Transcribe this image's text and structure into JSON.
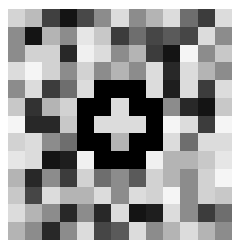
{
  "image": {
    "description": "Pixelated grayscale mosaic with a black ring and light cross shape at the center",
    "rows": 13,
    "cols": 13,
    "cells": [
      [
        "#d4d4d4",
        "#bbbbbb",
        "#404040",
        "#141414",
        "#484848",
        "#8c8c8c",
        "#dcdcdc",
        "#8c8c8c",
        "#b4b4b4",
        "#dcdcdc",
        "#6e6e6e",
        "#3c3c3c",
        "#dcdcdc"
      ],
      [
        "#8c8c8c",
        "#141414",
        "#b4b4b4",
        "#8c8c8c",
        "#e6e6e6",
        "#c8c8c8",
        "#3c3c3c",
        "#6e6e6e",
        "#464646",
        "#5a5a5a",
        "#464646",
        "#dcdcdc",
        "#8c8c8c"
      ],
      [
        "#8c8c8c",
        "#d2d2d2",
        "#d2d2d2",
        "#282828",
        "#f0f0f0",
        "#dcdcdc",
        "#8c8c8c",
        "#b4b4b4",
        "#3c3c3c",
        "#141414",
        "#f5f5f5",
        "#8c8c8c",
        "#c8c8c8"
      ],
      [
        "#dcdcdc",
        "#f5f5f5",
        "#d2d2d2",
        "#8c8c8c",
        "#d2d2d2",
        "#8c8c8c",
        "#b4b4b4",
        "#8c8c8c",
        "#dcdcdc",
        "#282828",
        "#dcdcdc",
        "#b4b4b4",
        "#8c8c8c"
      ],
      [
        "#8c8c8c",
        "#dcdcdc",
        "#3c3c3c",
        "#6e6e6e",
        "#dcdcdc",
        "#000000",
        "#000000",
        "#000000",
        "#dcdcdc",
        "#1e1e1e",
        "#dcdcdc",
        "#3c3c3c",
        "#dcdcdc"
      ],
      [
        "#c8c8c8",
        "#323232",
        "#b4b4b4",
        "#d2d2d2",
        "#000000",
        "#000000",
        "#dcdcdc",
        "#000000",
        "#000000",
        "#8c8c8c",
        "#282828",
        "#141414",
        "#c8c8c8"
      ],
      [
        "#f5f5f5",
        "#282828",
        "#282828",
        "#c8c8c8",
        "#000000",
        "#dcdcdc",
        "#dcdcdc",
        "#dcdcdc",
        "#000000",
        "#f5f5f5",
        "#dcdcdc",
        "#3c3c3c",
        "#f5f5f5"
      ],
      [
        "#d2d2d2",
        "#dcdcdc",
        "#8c8c8c",
        "#6e6e6e",
        "#000000",
        "#000000",
        "#b4b4b4",
        "#000000",
        "#000000",
        "#dcdcdc",
        "#6e6e6e",
        "#dcdcdc",
        "#dcdcdc"
      ],
      [
        "#e6e6e6",
        "#dcdcdc",
        "#141414",
        "#1e1e1e",
        "#f0f0f0",
        "#000000",
        "#000000",
        "#000000",
        "#f0f0f0",
        "#b4b4b4",
        "#b4b4b4",
        "#c8c8c8",
        "#e6e6e6"
      ],
      [
        "#b4b4b4",
        "#282828",
        "#8c8c8c",
        "#3c3c3c",
        "#d2d2d2",
        "#6e6e6e",
        "#8c8c8c",
        "#5a5a5a",
        "#d2d2d2",
        "#b4b4b4",
        "#8c8c8c",
        "#d2d2d2",
        "#f5f5f5"
      ],
      [
        "#c8c8c8",
        "#464646",
        "#dcdcdc",
        "#b4b4b4",
        "#b4b4b4",
        "#dcdcdc",
        "#8c8c8c",
        "#dcdcdc",
        "#d2d2d2",
        "#f5f5f5",
        "#8c8c8c",
        "#d2d2d2",
        "#c8c8c8"
      ],
      [
        "#dcdcdc",
        "#b4b4b4",
        "#8c8c8c",
        "#282828",
        "#8c8c8c",
        "#282828",
        "#dcdcdc",
        "#141414",
        "#1e1e1e",
        "#dcdcdc",
        "#8c8c8c",
        "#3c3c3c",
        "#6e6e6e"
      ],
      [
        "#b4b4b4",
        "#8c8c8c",
        "#282828",
        "#8c8c8c",
        "#dcdcdc",
        "#464646",
        "#5a5a5a",
        "#dcdcdc",
        "#8c8c8c",
        "#b4b4b4",
        "#dcdcdc",
        "#b4b4b4",
        "#8c8c8c"
      ]
    ]
  }
}
